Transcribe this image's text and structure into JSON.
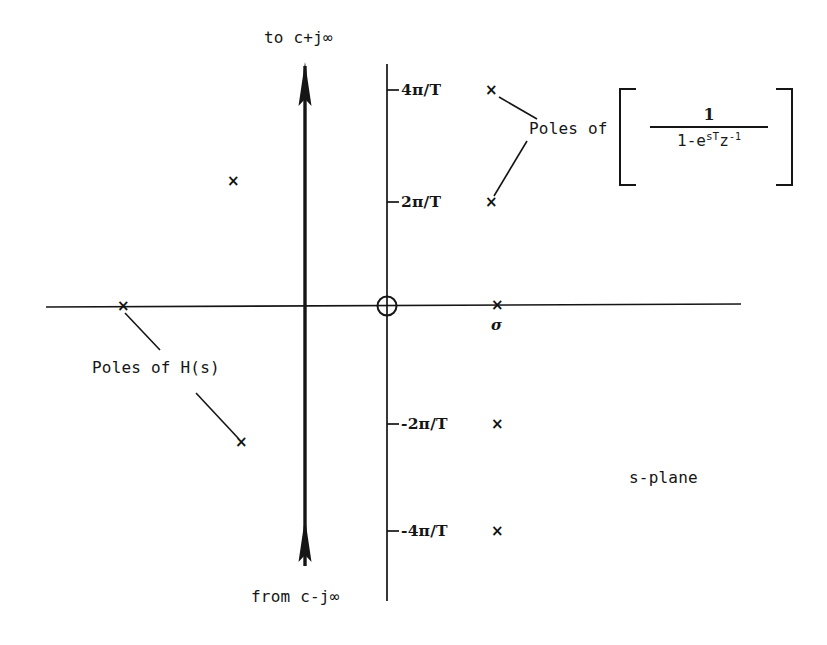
{
  "figure": {
    "name": "s-plane-contour-diagram",
    "plane_label": "s-plane",
    "stroke_color": "#151515",
    "background_color": "#ffffff"
  },
  "axes": {
    "real_axis_name": "real-axis",
    "imaginary_axis_name": "imaginary-axis",
    "sigma_label": "σ",
    "origin_marker": "origin-circle",
    "tick_labels": [
      {
        "text": "4π/T",
        "value": "4pi/T"
      },
      {
        "text": "2π/T",
        "value": "2pi/T"
      },
      {
        "text": "-2π/T",
        "value": "-2pi/T"
      },
      {
        "text": "-4π/T",
        "value": "-4pi/T"
      }
    ]
  },
  "contour": {
    "name": "bromwich-contour",
    "top_label": "to c+j∞",
    "bottom_label": "from c-j∞",
    "arrow_direction": "up"
  },
  "annotations": {
    "poles_of_hs": "Poles of H(s)",
    "poles_of_bracket": "Poles of",
    "bracket_open": "[",
    "bracket_close": "]",
    "formula": {
      "numerator": "1",
      "denominator_prefix": "1-e",
      "denominator_exponent": "sT",
      "denominator_z": "z",
      "denominator_z_exponent": "-1",
      "full": "1/(1-e^{sT}z^{-1})"
    }
  },
  "poles": {
    "marker_glyph": "×",
    "h_of_s_poles": [
      {
        "name": "pole-hs-real-axis",
        "x": 122,
        "y": 306
      },
      {
        "name": "pole-hs-lower-left",
        "x": 240,
        "y": 442
      },
      {
        "name": "pole-hs-upper-left",
        "x": 232,
        "y": 181
      }
    ],
    "sampled_poles": [
      {
        "name": "pole-sampled-4pi-T",
        "x": 490,
        "y": 90,
        "label": "4π/T"
      },
      {
        "name": "pole-sampled-2pi-T",
        "x": 490,
        "y": 202,
        "label": "2π/T"
      },
      {
        "name": "pole-sampled-0",
        "x": 496,
        "y": 306,
        "label": "0"
      },
      {
        "name": "pole-sampled-neg-2pi-T",
        "x": 496,
        "y": 424,
        "label": "-2π/T"
      },
      {
        "name": "pole-sampled-neg-4pi-T",
        "x": 496,
        "y": 531,
        "label": "-4π/T"
      }
    ]
  }
}
